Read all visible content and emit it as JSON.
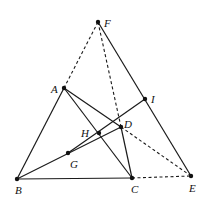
{
  "diagram": {
    "type": "geometry",
    "points": {
      "F": {
        "label": "F",
        "x": 98,
        "y": 22,
        "lx": 104,
        "ly": 27
      },
      "A": {
        "label": "A",
        "x": 64,
        "y": 88,
        "lx": 51,
        "ly": 93
      },
      "I": {
        "label": "I",
        "x": 145,
        "y": 99,
        "lx": 151,
        "ly": 103
      },
      "D": {
        "label": "D",
        "x": 121,
        "y": 127,
        "lx": 124,
        "ly": 128
      },
      "H": {
        "label": "H",
        "x": 99,
        "y": 133,
        "lx": 81,
        "ly": 137
      },
      "G": {
        "label": "G",
        "x": 68,
        "y": 153,
        "lx": 70,
        "ly": 168
      },
      "B": {
        "label": "B",
        "x": 17,
        "y": 179,
        "lx": 15,
        "ly": 194
      },
      "C": {
        "label": "C",
        "x": 132,
        "y": 178,
        "lx": 131,
        "ly": 193
      },
      "E": {
        "label": "E",
        "x": 191,
        "y": 176,
        "lx": 189,
        "ly": 192
      }
    },
    "segments_solid": [
      "AB",
      "BC",
      "AC",
      "AD",
      "DC",
      "BD",
      "GI",
      "FE"
    ],
    "segments_dashed": [
      "FA",
      "FD",
      "DE",
      "CE"
    ]
  }
}
